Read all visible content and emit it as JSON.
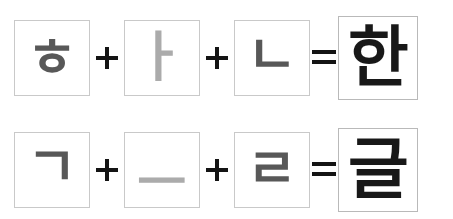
{
  "figure": {
    "colors": {
      "background": "#ffffff",
      "box_border": "#c9c9c9",
      "result_box_border": "#b9b9b9",
      "consonant": "#585858",
      "vowel": "#ababab",
      "syllable": "#181818",
      "operator": "#141414"
    }
  },
  "rows": [
    {
      "id": "row-han",
      "components": [
        {
          "glyph": "ㅎ",
          "name": "hieut",
          "kind": "consonant"
        },
        {
          "glyph": "ㅏ",
          "name": "a",
          "kind": "vowel"
        },
        {
          "glyph": "ㄴ",
          "name": "nieun",
          "kind": "consonant"
        }
      ],
      "operators": {
        "plus": "+",
        "equals": "="
      },
      "result": {
        "glyph": "한",
        "name": "han"
      }
    },
    {
      "id": "row-geul",
      "components": [
        {
          "glyph": "ㄱ",
          "name": "giyeok",
          "kind": "consonant"
        },
        {
          "glyph": "ㅡ",
          "name": "eu",
          "kind": "vowel"
        },
        {
          "glyph": "ㄹ",
          "name": "rieul",
          "kind": "consonant"
        }
      ],
      "operators": {
        "plus": "+",
        "equals": "="
      },
      "result": {
        "glyph": "글",
        "name": "geul"
      }
    }
  ]
}
